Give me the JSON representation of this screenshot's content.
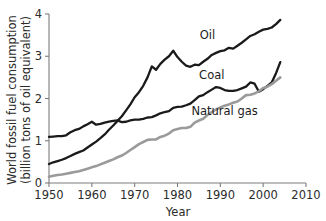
{
  "chart_data": {
    "type": "line",
    "title": "",
    "xlabel": "Year",
    "ylabel": "World fossil fuel consumption (billion tons of oil equivalent)",
    "ylabel_line1": "World fossil fuel consumption",
    "ylabel_line2": "(billion tons of oil equivalent)",
    "xlim": [
      1950,
      2010
    ],
    "ylim": [
      0,
      4
    ],
    "xticks": [
      1950,
      1960,
      1970,
      1980,
      1990,
      2000,
      2010
    ],
    "xtick_labels": [
      "1950",
      "1960",
      "1970",
      "1980",
      "1990",
      "2000",
      "2010"
    ],
    "yticks": [
      0,
      1,
      2,
      3,
      4
    ],
    "ytick_labels": [
      "0",
      "1",
      "2",
      "3",
      "4"
    ],
    "grid": false,
    "legend_position": "inline-annotations",
    "series": [
      {
        "name": "Oil",
        "color": "#1a1a1a",
        "label_x": 1987,
        "label_y": 3.42,
        "x": [
          1950,
          1951,
          1952,
          1953,
          1954,
          1955,
          1956,
          1957,
          1958,
          1959,
          1960,
          1961,
          1962,
          1963,
          1964,
          1965,
          1966,
          1967,
          1968,
          1969,
          1970,
          1971,
          1972,
          1973,
          1974,
          1975,
          1976,
          1977,
          1978,
          1979,
          1980,
          1981,
          1982,
          1983,
          1984,
          1985,
          1986,
          1987,
          1988,
          1989,
          1990,
          1991,
          1992,
          1993,
          1994,
          1995,
          1996,
          1997,
          1998,
          1999,
          2000,
          2001,
          2002,
          2003,
          2004
        ],
        "values": [
          0.45,
          0.49,
          0.52,
          0.55,
          0.59,
          0.64,
          0.69,
          0.73,
          0.77,
          0.84,
          0.91,
          0.98,
          1.06,
          1.15,
          1.26,
          1.36,
          1.47,
          1.58,
          1.72,
          1.86,
          2.03,
          2.15,
          2.3,
          2.5,
          2.76,
          2.68,
          2.82,
          2.92,
          3.0,
          3.13,
          2.98,
          2.87,
          2.78,
          2.75,
          2.8,
          2.79,
          2.87,
          2.94,
          3.03,
          3.08,
          3.12,
          3.14,
          3.2,
          3.18,
          3.25,
          3.32,
          3.4,
          3.48,
          3.52,
          3.58,
          3.63,
          3.65,
          3.68,
          3.76,
          3.86
        ]
      },
      {
        "name": "Coal",
        "color": "#1a1a1a",
        "label_x": 1988,
        "label_y": 2.45,
        "x": [
          1950,
          1951,
          1952,
          1953,
          1954,
          1955,
          1956,
          1957,
          1958,
          1959,
          1960,
          1961,
          1962,
          1963,
          1964,
          1965,
          1966,
          1967,
          1968,
          1969,
          1970,
          1971,
          1972,
          1973,
          1974,
          1975,
          1976,
          1977,
          1978,
          1979,
          1980,
          1981,
          1982,
          1983,
          1984,
          1985,
          1986,
          1987,
          1988,
          1989,
          1990,
          1991,
          1992,
          1993,
          1994,
          1995,
          1996,
          1997,
          1998,
          1999,
          2000,
          2001,
          2002,
          2003,
          2004
        ],
        "values": [
          1.09,
          1.1,
          1.11,
          1.11,
          1.13,
          1.2,
          1.25,
          1.28,
          1.34,
          1.39,
          1.45,
          1.38,
          1.4,
          1.43,
          1.45,
          1.47,
          1.48,
          1.44,
          1.45,
          1.48,
          1.5,
          1.5,
          1.52,
          1.55,
          1.56,
          1.6,
          1.65,
          1.68,
          1.7,
          1.78,
          1.8,
          1.81,
          1.84,
          1.88,
          1.96,
          2.05,
          2.08,
          2.15,
          2.21,
          2.27,
          2.25,
          2.2,
          2.18,
          2.18,
          2.2,
          2.24,
          2.28,
          2.38,
          2.35,
          2.16,
          2.22,
          2.3,
          2.38,
          2.6,
          2.86
        ]
      },
      {
        "name": "Natural gas",
        "color": "#9a9a9a",
        "label_x": 1991,
        "label_y": 1.62,
        "x": [
          1950,
          1951,
          1952,
          1953,
          1954,
          1955,
          1956,
          1957,
          1958,
          1959,
          1960,
          1961,
          1962,
          1963,
          1964,
          1965,
          1966,
          1967,
          1968,
          1969,
          1970,
          1971,
          1972,
          1973,
          1974,
          1975,
          1976,
          1977,
          1978,
          1979,
          1980,
          1981,
          1982,
          1983,
          1984,
          1985,
          1986,
          1987,
          1988,
          1989,
          1990,
          1991,
          1992,
          1993,
          1994,
          1995,
          1996,
          1997,
          1998,
          1999,
          2000,
          2001,
          2002,
          2003,
          2004
        ],
        "values": [
          0.15,
          0.17,
          0.19,
          0.2,
          0.22,
          0.24,
          0.26,
          0.28,
          0.31,
          0.34,
          0.37,
          0.4,
          0.44,
          0.48,
          0.52,
          0.56,
          0.61,
          0.65,
          0.71,
          0.78,
          0.85,
          0.92,
          0.97,
          1.02,
          1.03,
          1.03,
          1.09,
          1.12,
          1.17,
          1.25,
          1.28,
          1.3,
          1.3,
          1.33,
          1.43,
          1.48,
          1.52,
          1.61,
          1.68,
          1.74,
          1.79,
          1.83,
          1.86,
          1.9,
          1.93,
          2.0,
          2.08,
          2.09,
          2.12,
          2.17,
          2.25,
          2.28,
          2.34,
          2.42,
          2.5
        ]
      }
    ]
  }
}
